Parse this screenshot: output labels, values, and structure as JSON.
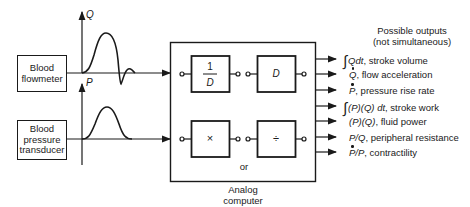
{
  "inputs": {
    "flowmeter": {
      "label_line1": "Blood",
      "label_line2": "flowmeter"
    },
    "pressure": {
      "label_line1": "Blood",
      "label_line2": "pressure",
      "label_line3": "transducer"
    }
  },
  "axes": {
    "q_label": "Q",
    "p_label": "P"
  },
  "computer": {
    "label_line1": "Analog",
    "label_line2": "computer",
    "blocks": {
      "integrator_num": "1",
      "integrator_den": "D",
      "differentiator": "D",
      "multiplier": "×",
      "divider": "÷"
    },
    "or_label": "or"
  },
  "outputs": {
    "header_line1": "Possible outputs",
    "header_line2": "(not simultaneous)",
    "items": [
      {
        "expr": "Qdt",
        "prefix": "∫",
        "desc": ", stroke volume"
      },
      {
        "expr": "Q",
        "dotted": true,
        "desc": ", flow acceleration"
      },
      {
        "expr": "P",
        "dotted": true,
        "desc": ", pressure rise rate"
      },
      {
        "expr": "(P)(Q) dt",
        "prefix": "∫",
        "desc": ", stroke work"
      },
      {
        "expr": "(P)(Q)",
        "desc": ", fluid power"
      },
      {
        "expr": "P/Q",
        "desc": ", peripheral resistance"
      },
      {
        "expr": "P",
        "dotted": true,
        "expr_suffix": "/P",
        "desc": ", contractility"
      }
    ]
  }
}
